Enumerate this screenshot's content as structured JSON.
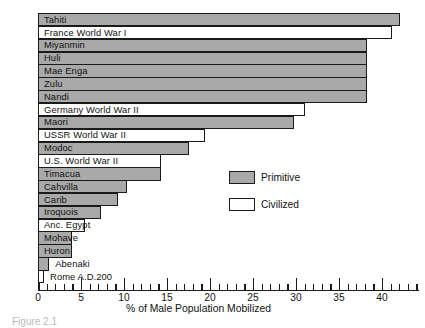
{
  "chart_data": {
    "type": "bar",
    "orientation": "horizontal",
    "title": "",
    "xlabel": "% of Male Population Mobilized",
    "ylabel": "",
    "xlim": [
      0,
      44.3
    ],
    "grid": false,
    "xticks_major": [
      0,
      5,
      10,
      15,
      20,
      25,
      30,
      35,
      40
    ],
    "xtick_labels": [
      "0",
      "5",
      "10",
      "15",
      "20",
      "25",
      "30",
      "35",
      "40"
    ],
    "xtick_minor_step": 1,
    "categories": [
      "Tahiti",
      "France World War I",
      "Miyanmin",
      "Huli",
      "Mae Enga",
      "Zulu",
      "Nandi",
      "Germany World War II",
      "Maori",
      "USSR World War II",
      "Modoc",
      "U.S. World War II",
      "Timacua",
      "Cahvilla",
      "Carib",
      "Iroquois",
      "Anc. Egypt",
      "Mohave",
      "Huron",
      "Abenaki",
      "Rome A.D.200"
    ],
    "values": [
      42.1,
      41.2,
      38.3,
      38.3,
      38.3,
      38.3,
      38.3,
      31.0,
      29.8,
      19.4,
      17.6,
      14.3,
      14.3,
      10.3,
      9.3,
      7.3,
      5.5,
      4.0,
      4.0,
      1.3,
      0.7
    ],
    "series_groups": [
      "Primitive",
      "Civilized",
      "Primitive",
      "Primitive",
      "Primitive",
      "Primitive",
      "Primitive",
      "Civilized",
      "Primitive",
      "Civilized",
      "Primitive",
      "Civilized",
      "Primitive",
      "Primitive",
      "Primitive",
      "Primitive",
      "Civilized",
      "Primitive",
      "Primitive",
      "Primitive",
      "Civilized"
    ],
    "label_placement": [
      "inside",
      "inside",
      "inside",
      "inside",
      "inside",
      "inside",
      "inside",
      "inside",
      "inside",
      "inside",
      "inside",
      "inside",
      "inside",
      "inside",
      "inside",
      "inside",
      "inside",
      "inside",
      "inside",
      "outside",
      "outside"
    ],
    "legend": {
      "position": "center-right",
      "entries": [
        {
          "label": "Primitive",
          "color": "#a9a9a9"
        },
        {
          "label": "Civilized",
          "color": "#ffffff"
        }
      ]
    },
    "colors": {
      "primitive_fill": "#a9a9a9",
      "civilized_fill": "#ffffff",
      "outline": "#1a1a1a",
      "background": "#ffffff"
    }
  },
  "caption": "Figure 2.1"
}
